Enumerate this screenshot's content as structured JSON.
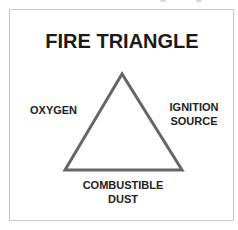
{
  "diagram": {
    "title": "FIRE TRIANGLE",
    "sides": {
      "left": "OXYGEN",
      "right_line1": "IGNITION",
      "right_line2": "SOURCE",
      "bottom_line1": "COMBUSTIBLE",
      "bottom_line2": "DUST"
    },
    "colors": {
      "stroke": "#666666",
      "text": "#222222",
      "frame": "#c8c8c8"
    }
  }
}
